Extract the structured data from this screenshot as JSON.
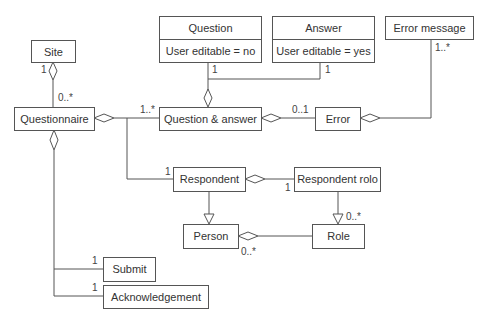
{
  "diagram": {
    "type": "uml-class-diagram",
    "classes": {
      "site": {
        "name": "Site"
      },
      "question": {
        "name": "Question",
        "attribute": "User editable = no"
      },
      "answer": {
        "name": "Answer",
        "attribute": "User editable = yes"
      },
      "error_message": {
        "name": "Error message"
      },
      "questionnaire": {
        "name": "Questionnaire"
      },
      "question_answer": {
        "name": "Question & answer"
      },
      "error": {
        "name": "Error"
      },
      "respondent": {
        "name": "Respondent"
      },
      "respondent_role": {
        "name": "Respondent rolo"
      },
      "person": {
        "name": "Person"
      },
      "role": {
        "name": "Role"
      },
      "submit": {
        "name": "Submit"
      },
      "acknowledgement": {
        "name": "Acknowledgement"
      }
    },
    "multiplicities": {
      "site_questionnaire_site": "1",
      "site_questionnaire_questionnaire": "0..*",
      "questionnaire_qa": "1..*",
      "question_qa": "1",
      "answer_qa": "1",
      "qa_error": "0..1",
      "error_message": "1..*",
      "questionnaire_respondent": "1",
      "respondent_role_respondent": "1",
      "respondent_role_role": "0..*",
      "person_role": "0..*",
      "questionnaire_submit": "1",
      "questionnaire_acknowledgement": "1"
    },
    "relationships": [
      {
        "from": "Site",
        "to": "Questionnaire",
        "kind": "aggregation"
      },
      {
        "from": "Questionnaire",
        "to": "Question & answer",
        "kind": "aggregation"
      },
      {
        "from": "Question & answer",
        "to": "Question",
        "kind": "aggregation"
      },
      {
        "from": "Question & answer",
        "to": "Answer",
        "kind": "aggregation"
      },
      {
        "from": "Question & answer",
        "to": "Error",
        "kind": "aggregation"
      },
      {
        "from": "Error",
        "to": "Error message",
        "kind": "aggregation"
      },
      {
        "from": "Questionnaire",
        "to": "Respondent",
        "kind": "aggregation"
      },
      {
        "from": "Respondent",
        "to": "Respondent rolo",
        "kind": "aggregation"
      },
      {
        "from": "Respondent",
        "to": "Person",
        "kind": "generalization"
      },
      {
        "from": "Respondent rolo",
        "to": "Role",
        "kind": "generalization"
      },
      {
        "from": "Person",
        "to": "Role",
        "kind": "aggregation"
      },
      {
        "from": "Questionnaire",
        "to": "Submit",
        "kind": "aggregation"
      },
      {
        "from": "Questionnaire",
        "to": "Acknowledgement",
        "kind": "aggregation"
      }
    ]
  }
}
